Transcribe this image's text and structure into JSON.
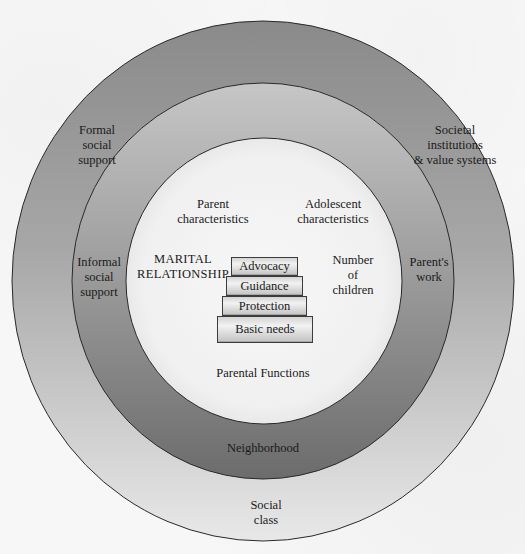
{
  "diagram": {
    "type": "nested-circles",
    "rings": {
      "outer": {
        "labels": {
          "top_left": [
            "Formal",
            "social",
            "support"
          ],
          "top_right": [
            "Societal",
            "institutions",
            "& value systems"
          ],
          "bottom": [
            "Social",
            "class"
          ]
        },
        "gradient_top": "#8d8d8d",
        "gradient_bottom": "#e6e6e6"
      },
      "middle": {
        "labels": {
          "left": [
            "Informal",
            "social",
            "support"
          ],
          "right": [
            "Parent's",
            "work"
          ],
          "bottom": "Neighborhood"
        },
        "gradient_top": "#c4c4c4",
        "gradient_bottom": "#6e6e6e"
      },
      "inner": {
        "labels": {
          "parent": [
            "Parent",
            "characteristics"
          ],
          "adolescent": [
            "Adolescent",
            "characteristics"
          ],
          "marital": [
            "MARITAL",
            "RELATIONSHIP"
          ],
          "children": [
            "Number",
            "of",
            "children"
          ],
          "functions_caption": "Parental Functions"
        },
        "fill": "#f4f4f4"
      }
    },
    "parental_functions": [
      "Advocacy",
      "Guidance",
      "Protection",
      "Basic needs"
    ],
    "stroke": "#2a2a2a"
  }
}
